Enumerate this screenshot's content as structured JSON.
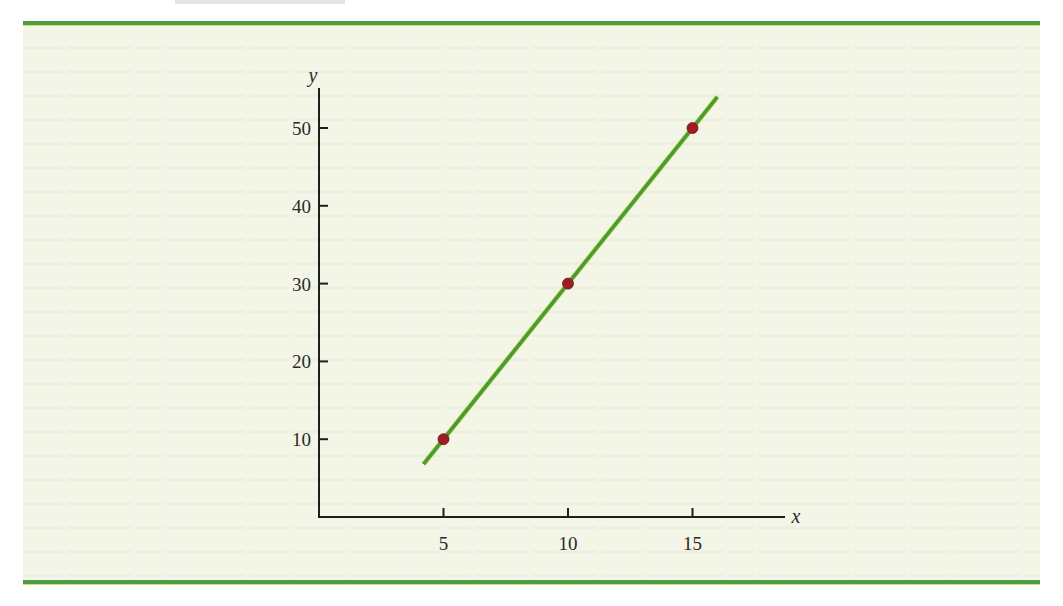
{
  "chart_data": {
    "type": "scatter",
    "title": "",
    "xlabel": "x",
    "ylabel": "y",
    "x_ticks": [
      5,
      10,
      15
    ],
    "y_ticks": [
      10,
      20,
      30,
      40,
      50
    ],
    "xlim": [
      0,
      17.5
    ],
    "ylim": [
      0,
      55
    ],
    "grid": false,
    "legend": null,
    "series": [
      {
        "name": "points",
        "kind": "scatter",
        "color": "#a01c24",
        "x": [
          5,
          10,
          15
        ],
        "y": [
          10,
          30,
          50
        ]
      },
      {
        "name": "line",
        "kind": "line",
        "color": "#4a9a3c",
        "equation": "y = 4x - 10",
        "x": [
          4.2,
          16.0
        ],
        "y": [
          6.8,
          54.0
        ]
      }
    ]
  },
  "labels": {
    "x_axis": "x",
    "y_axis": "y",
    "x_tick_labels": [
      "5",
      "10",
      "15"
    ],
    "y_tick_labels": [
      "10",
      "20",
      "30",
      "40",
      "50"
    ]
  },
  "colors": {
    "panel_bg": "#f3f5e7",
    "rule": "#4f9a45",
    "axis": "#1e1e1e",
    "line": "#4a9a3c",
    "point": "#a01c24"
  }
}
